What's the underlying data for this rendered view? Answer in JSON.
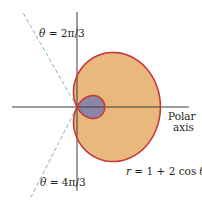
{
  "figure": {
    "equation": "r = 1 + 2 cos θ",
    "equation_parts": {
      "r": "r",
      "rest": " = 1 + 2 cos ",
      "theta": "θ"
    },
    "polar_axis_label_line1": "Polar",
    "polar_axis_label_line2": "axis",
    "ray_upper_label": {
      "theta": "θ",
      "rest": " = 2π/3"
    },
    "ray_lower_label": {
      "theta": "θ",
      "rest": " = 4π/3"
    },
    "curve": {
      "a": 1,
      "b": 2,
      "function": "cos"
    },
    "colors": {
      "outer_fill": "#e9b87d",
      "inner_fill": "#8b86a8",
      "curve_stroke": "#c8383a",
      "axis": "#3a3a3a",
      "ray_dashed": "#7fb3c6"
    }
  },
  "chart_data": {
    "type": "line",
    "title": "",
    "equation": "r = 1 + 2 cos θ",
    "coordinate_system": "polar",
    "annotations": [
      "θ = 2π/3",
      "θ = 4π/3",
      "Polar axis",
      "r = 1 + 2 cos θ"
    ],
    "key_points": [
      {
        "theta": "0",
        "r": 3
      },
      {
        "theta": "π/2",
        "r": 1
      },
      {
        "theta": "2π/3",
        "r": 0
      },
      {
        "theta": "π",
        "r": -1
      },
      {
        "theta": "4π/3",
        "r": 0
      },
      {
        "theta": "3π/2",
        "r": 1
      }
    ],
    "regions": [
      "outer loop (shaded tan)",
      "inner loop (shaded gray-blue)"
    ]
  }
}
